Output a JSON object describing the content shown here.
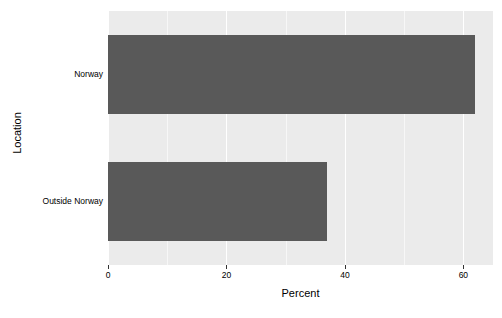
{
  "chart_data": {
    "type": "bar",
    "orientation": "horizontal",
    "title": "",
    "subtitle": "",
    "xlabel": "Percent",
    "ylabel": "Location",
    "categories": [
      "Norway",
      "Outside Norway"
    ],
    "values": [
      62,
      37
    ],
    "series": [
      {
        "name": "Percent",
        "values": [
          62,
          37
        ]
      }
    ],
    "xlim": [
      0,
      65
    ],
    "xticks": [
      0,
      20,
      40,
      60
    ],
    "xticklabels": [
      "0",
      "20",
      "40",
      "60"
    ],
    "minor_xticks": [
      10,
      30,
      50
    ],
    "grid": true,
    "grid_axis": "x",
    "legend": false,
    "legend_position": "none",
    "colors": {
      "bar": "#595959",
      "panel_background": "#ebebeb",
      "major_gridline": "#ffffff",
      "minor_gridline": "#f7f7f7",
      "text": "#000000",
      "figure_background": "#ffffff"
    }
  }
}
